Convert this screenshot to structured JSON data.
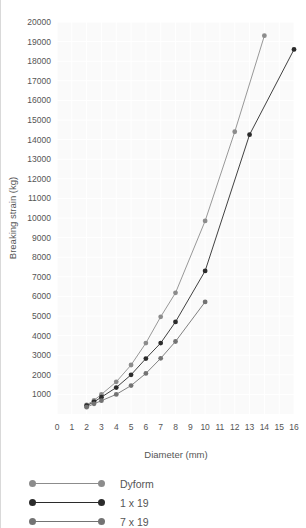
{
  "chart_data": {
    "type": "line",
    "title": "",
    "xlabel": "Diameter (mm)",
    "ylabel": "Breaking strain (kg)",
    "xlim": [
      0,
      16
    ],
    "ylim": [
      0,
      20000
    ],
    "xticks": [
      0,
      1,
      2,
      3,
      4,
      5,
      6,
      7,
      8,
      9,
      10,
      11,
      12,
      13,
      14,
      15,
      16
    ],
    "yticks": [
      1000,
      2000,
      3000,
      4000,
      5000,
      6000,
      7000,
      8000,
      9000,
      10000,
      11000,
      12000,
      13000,
      14000,
      15000,
      16000,
      17000,
      18000,
      19000,
      20000
    ],
    "grid": true,
    "legend_position": "below",
    "markers": "circle",
    "series": [
      {
        "name": "Dyform",
        "color": "#8c8c8c",
        "points": [
          {
            "x": 2,
            "y": 460
          },
          {
            "x": 2.5,
            "y": 700
          },
          {
            "x": 3,
            "y": 1000
          },
          {
            "x": 4,
            "y": 1640
          },
          {
            "x": 5,
            "y": 2500
          },
          {
            "x": 6,
            "y": 3620
          },
          {
            "x": 7,
            "y": 4960
          },
          {
            "x": 8,
            "y": 6180
          },
          {
            "x": 10,
            "y": 9850
          },
          {
            "x": 12,
            "y": 14400
          },
          {
            "x": 14,
            "y": 19300
          }
        ]
      },
      {
        "name": "1 x 19",
        "color": "#2b2b2b",
        "points": [
          {
            "x": 2,
            "y": 420
          },
          {
            "x": 2.5,
            "y": 620
          },
          {
            "x": 3,
            "y": 860
          },
          {
            "x": 4,
            "y": 1350
          },
          {
            "x": 5,
            "y": 2000
          },
          {
            "x": 6,
            "y": 2830
          },
          {
            "x": 7,
            "y": 3620
          },
          {
            "x": 8,
            "y": 4700
          },
          {
            "x": 10,
            "y": 7300
          },
          {
            "x": 13,
            "y": 14250
          },
          {
            "x": 16,
            "y": 18600
          }
        ]
      },
      {
        "name": "7 x 19",
        "color": "#737373",
        "points": [
          {
            "x": 2,
            "y": 350
          },
          {
            "x": 2.5,
            "y": 520
          },
          {
            "x": 3,
            "y": 680
          },
          {
            "x": 4,
            "y": 1000
          },
          {
            "x": 5,
            "y": 1450
          },
          {
            "x": 6,
            "y": 2070
          },
          {
            "x": 7,
            "y": 2840
          },
          {
            "x": 8,
            "y": 3700
          },
          {
            "x": 10,
            "y": 5720
          }
        ]
      }
    ]
  },
  "legend": {
    "items": [
      {
        "label": "Dyform",
        "color": "#8c8c8c"
      },
      {
        "label": "1 x 19",
        "color": "#2b2b2b"
      },
      {
        "label": "7 x 19",
        "color": "#737373"
      }
    ]
  },
  "colors": {
    "plot_background": "#fafafa",
    "gridline": "#ffffff",
    "text": "#555555",
    "edge_rule": "#d9d9d9"
  }
}
